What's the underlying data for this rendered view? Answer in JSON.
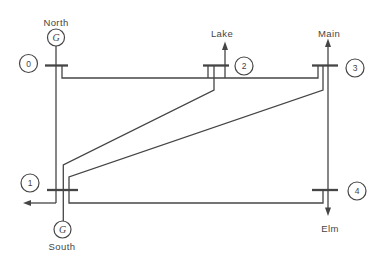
{
  "figure": {
    "kind": "power-system-single-line-diagram",
    "generator_symbol": "G",
    "buses": [
      {
        "number": "0",
        "name": "North",
        "attachments": [
          "generator"
        ]
      },
      {
        "number": "1",
        "name": "South",
        "attachments": [
          "generator",
          "load-arrow-left"
        ]
      },
      {
        "number": "2",
        "name": "Lake",
        "attachments": [
          "load-arrow-up"
        ]
      },
      {
        "number": "3",
        "name": "Main",
        "attachments": [
          "load-arrow-up"
        ]
      },
      {
        "number": "4",
        "name": "Elm",
        "attachments": [
          "load-arrow-down"
        ]
      }
    ],
    "transmission_lines": [
      {
        "from": "0",
        "to": "1"
      },
      {
        "from": "0",
        "to": "2"
      },
      {
        "from": "1",
        "to": "2"
      },
      {
        "from": "1",
        "to": "3"
      },
      {
        "from": "1",
        "to": "4"
      },
      {
        "from": "2",
        "to": "3"
      },
      {
        "from": "3",
        "to": "4"
      }
    ]
  },
  "colors": {
    "ink": "#454545",
    "background": "#ffffff"
  }
}
